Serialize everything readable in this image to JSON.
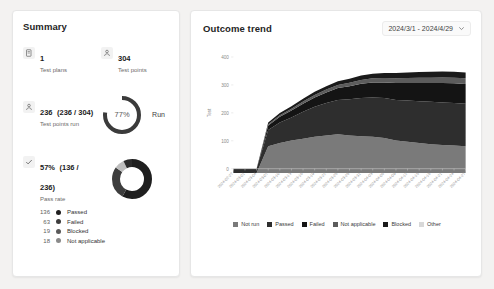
{
  "summary": {
    "title": "Summary",
    "metrics": [
      {
        "icon": "test-plan-icon",
        "value": "1",
        "sub": "",
        "label": "Test plans"
      },
      {
        "icon": "test-point-icon",
        "value": "304",
        "sub": "",
        "label": "Test points"
      }
    ],
    "run_block": {
      "icon": "test-point-icon",
      "value": "236",
      "sub": "(236 / 304)",
      "label": "Test points run",
      "percent_text": "77%",
      "percent": 77,
      "chart_label": "Run",
      "arc_color": "#3b3b3b",
      "track_color": "#ffffff"
    },
    "pass_block": {
      "icon": "check-icon",
      "value": "57%",
      "sub": "(136 / 236)",
      "label": "Pass rate",
      "segments": [
        {
          "name": "Passed",
          "value": 136,
          "color": "#1f1f1f"
        },
        {
          "name": "Failed",
          "value": 63,
          "color": "#3d3d3d"
        },
        {
          "name": "Blocked",
          "value": 19,
          "color": "#bdbdbd"
        },
        {
          "name": "Not applicable",
          "value": 18,
          "color": "#2b2b2b"
        }
      ]
    },
    "legend": [
      {
        "count": "136",
        "label": "Passed",
        "color": "#1f1f1f"
      },
      {
        "count": "63",
        "label": "Failed",
        "color": "#3d3d3d"
      },
      {
        "count": "19",
        "label": "Blocked",
        "color": "#5a5a5a"
      },
      {
        "count": "18",
        "label": "Not applicable",
        "color": "#8a8a8a"
      }
    ]
  },
  "trend": {
    "title": "Outcome trend",
    "date_range": "2024/3/1 - 2024/4/29",
    "chevron": "chevron-down-icon"
  },
  "chart_data": {
    "type": "area",
    "title": "Outcome trend",
    "xlabel": "",
    "ylabel": "Test",
    "ylim": [
      0,
      400
    ],
    "yticks": [
      0,
      100,
      200,
      300,
      400
    ],
    "grid": false,
    "legend_position": "bottom",
    "x": [
      "2024-02-27",
      "2024-03-01",
      "2024-03-04",
      "2024-03-07",
      "2024-03-10",
      "2024-03-13",
      "2024-03-16",
      "2024-03-19",
      "2024-03-22",
      "2024-03-25",
      "2024-03-28",
      "2024-03-31",
      "2024-04-03",
      "2024-04-06",
      "2024-04-09",
      "2024-04-12",
      "2024-04-15",
      "2024-04-18",
      "2024-04-21",
      "2024-04-24",
      "2024-04-27"
    ],
    "series": [
      {
        "name": "Not run",
        "color": "#7a7a7a",
        "values": [
          0,
          0,
          0,
          86,
          96,
          104,
          110,
          116,
          120,
          124,
          120,
          118,
          116,
          112,
          104,
          100,
          96,
          92,
          90,
          88,
          86
        ]
      },
      {
        "name": "Passed",
        "color": "#2e2e2e",
        "values": [
          14,
          14,
          14,
          52,
          66,
          74,
          86,
          96,
          104,
          110,
          116,
          122,
          126,
          128,
          130,
          132,
          134,
          136,
          136,
          136,
          136
        ]
      },
      {
        "name": "Failed",
        "color": "#141414",
        "values": [
          0,
          0,
          0,
          14,
          18,
          22,
          26,
          30,
          34,
          38,
          42,
          46,
          48,
          50,
          54,
          56,
          58,
          60,
          62,
          63,
          63
        ]
      },
      {
        "name": "Not applicable",
        "color": "#5c5c5c",
        "values": [
          0,
          0,
          0,
          4,
          5,
          6,
          7,
          8,
          9,
          10,
          11,
          12,
          13,
          14,
          15,
          16,
          17,
          17,
          18,
          18,
          18
        ]
      },
      {
        "name": "Blocked",
        "color": "#1a1a1a",
        "values": [
          0,
          0,
          0,
          6,
          7,
          8,
          9,
          10,
          11,
          12,
          13,
          14,
          15,
          16,
          17,
          18,
          18,
          19,
          19,
          19,
          19
        ]
      },
      {
        "name": "Other",
        "color": "#d8d8d8",
        "values": [
          0,
          0,
          0,
          0,
          0,
          0,
          0,
          0,
          0,
          0,
          0,
          0,
          0,
          0,
          0,
          0,
          0,
          0,
          0,
          0,
          0
        ]
      }
    ]
  }
}
